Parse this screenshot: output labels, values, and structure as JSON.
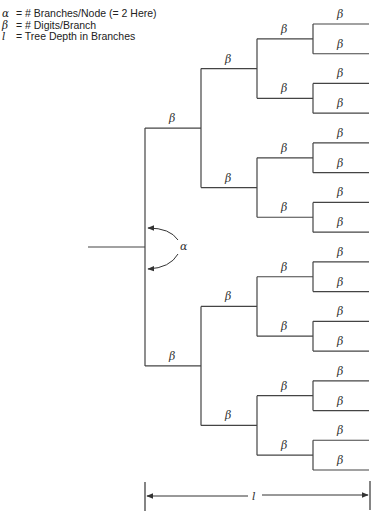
{
  "legend": [
    {
      "symbol": "α",
      "eq": "=",
      "text": "# Branches/Node (= 2 Here)"
    },
    {
      "symbol": "β",
      "eq": "=",
      "text": "# Digits/Branch"
    },
    {
      "symbol": "l",
      "eq": "=",
      "text": "Tree Depth in Branches"
    }
  ],
  "branch_label": "β",
  "fanout_label": "α",
  "depth_label": "l",
  "tree": {
    "branches_per_node": 2,
    "levels": 4,
    "leaf_count": 16,
    "line_color": "#444444"
  }
}
